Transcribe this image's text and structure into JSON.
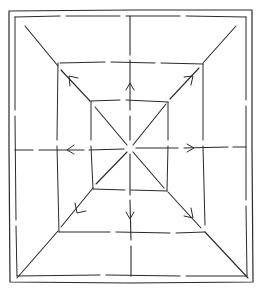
{
  "diagram": {
    "type": "hand-drawn nested rectangles with radial arrows",
    "stroke_color": "#2a2a2a",
    "background_color": "#ffffff",
    "center": [
      130,
      148
    ],
    "frames": {
      "outer_border": [
        9,
        10,
        252,
        282
      ],
      "inner_border": [
        15,
        16,
        246,
        276
      ],
      "middle_rect": [
        58,
        63,
        203,
        233
      ],
      "inner_rect": [
        91,
        100,
        168,
        191
      ]
    },
    "lines": [
      {
        "name": "vertical-axis",
        "from": [
          130,
          16
        ],
        "to": [
          130,
          276
        ],
        "dashed": true
      },
      {
        "name": "horizontal-axis",
        "from": [
          15,
          149
        ],
        "to": [
          246,
          147
        ],
        "dashed": true
      },
      {
        "name": "diagonal-top-left",
        "from": [
          25,
          26
        ],
        "to": [
          130,
          148
        ]
      },
      {
        "name": "diagonal-top-right",
        "from": [
          236,
          26
        ],
        "to": [
          130,
          148
        ]
      },
      {
        "name": "diagonal-bottom-left",
        "from": [
          17,
          278
        ],
        "to": [
          130,
          148
        ]
      },
      {
        "name": "diagonal-bottom-right",
        "from": [
          248,
          278
        ],
        "to": [
          130,
          148
        ]
      }
    ],
    "arrows": [
      {
        "name": "arrow-up",
        "at": [
          130,
          84
        ],
        "direction": "up"
      },
      {
        "name": "arrow-down",
        "at": [
          130,
          218
        ],
        "direction": "down"
      },
      {
        "name": "arrow-left",
        "at": [
          68,
          149
        ],
        "direction": "left"
      },
      {
        "name": "arrow-right",
        "at": [
          193,
          148
        ],
        "direction": "right"
      },
      {
        "name": "arrow-up-left",
        "at": [
          70,
          77
        ],
        "direction": "up-left"
      },
      {
        "name": "arrow-up-right",
        "at": [
          191,
          77
        ],
        "direction": "up-right"
      },
      {
        "name": "arrow-down-left",
        "at": [
          78,
          212
        ],
        "direction": "down-left"
      },
      {
        "name": "arrow-down-right",
        "at": [
          192,
          216
        ],
        "direction": "down-right"
      }
    ]
  }
}
